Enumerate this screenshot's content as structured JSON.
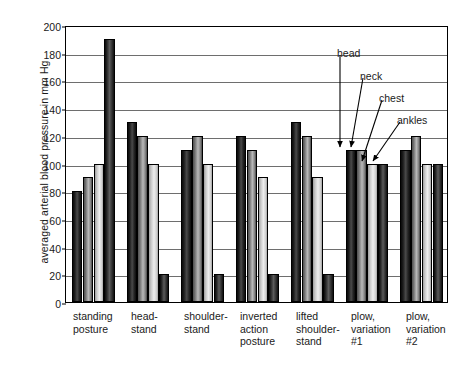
{
  "chart_data": {
    "type": "bar",
    "title": "",
    "xlabel": "",
    "ylabel": "averaged arterial blood pressure in mm Hg",
    "ylim": [
      0,
      200
    ],
    "ytick_values": [
      0,
      20,
      40,
      60,
      80,
      100,
      120,
      140,
      160,
      180,
      200
    ],
    "ytick_labels": [
      "0",
      "20",
      "40",
      "60",
      "80",
      "100",
      "120",
      "140",
      "160",
      "180",
      "200"
    ],
    "grid": "horizontal",
    "legend_position": "none",
    "categories": [
      "standing posture",
      "head-stand",
      "shoulder-stand",
      "inverted action posture",
      "lifted shoulder-stand",
      "plow, variation #1",
      "plow, variation #2"
    ],
    "category_label_lines": [
      [
        "standing",
        "posture"
      ],
      [
        "head-",
        "stand"
      ],
      [
        "shoulder-",
        "stand"
      ],
      [
        "inverted",
        "action",
        "posture"
      ],
      [
        "lifted",
        "shoulder-",
        "stand"
      ],
      [
        "plow,",
        "variation",
        "#1"
      ],
      [
        "plow,",
        "variation",
        "#2"
      ]
    ],
    "series": [
      {
        "name": "head",
        "values": [
          80,
          130,
          110,
          120,
          130,
          110,
          110
        ]
      },
      {
        "name": "neck",
        "values": [
          90,
          120,
          120,
          110,
          120,
          110,
          120
        ]
      },
      {
        "name": "chest",
        "values": [
          100,
          100,
          100,
          90,
          90,
          100,
          100
        ]
      },
      {
        "name": "ankles",
        "values": [
          190,
          20,
          20,
          20,
          20,
          100,
          100
        ]
      }
    ],
    "annotations": [
      {
        "text": "head",
        "target_group": "plow, variation #1",
        "target_series": "head"
      },
      {
        "text": "neck",
        "target_group": "plow, variation #1",
        "target_series": "neck"
      },
      {
        "text": "chest",
        "target_group": "plow, variation #1",
        "target_series": "chest"
      },
      {
        "text": "ankles",
        "target_group": "plow, variation #1",
        "target_series": "ankles"
      }
    ]
  },
  "colors": {
    "background": "#ffffff",
    "axis": "#000000",
    "grid": "#555555",
    "text": "#1a1a1a",
    "series_tones": [
      "#1d1d1d",
      "#8a8a8a",
      "#dcdcdc",
      "#262626"
    ]
  }
}
